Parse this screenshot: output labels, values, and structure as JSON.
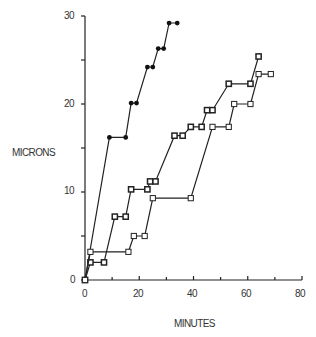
{
  "chart_data": {
    "type": "line",
    "title": "",
    "xlabel": "MINUTES",
    "ylabel": "MICRONS",
    "xlim": [
      0,
      80
    ],
    "ylim": [
      0,
      30
    ],
    "x_ticks": [
      0,
      20,
      40,
      60,
      80
    ],
    "y_ticks": [
      0,
      10,
      20,
      30
    ],
    "grid": false,
    "legend": null,
    "series": [
      {
        "name": "filled-diamonds",
        "marker": "filled",
        "x": [
          0,
          9,
          15,
          17,
          19,
          23,
          25,
          27,
          29,
          31,
          34
        ],
        "y": [
          0,
          16.2,
          16.2,
          20.1,
          20.1,
          24.2,
          24.2,
          26.3,
          26.3,
          29.2,
          29.2
        ]
      },
      {
        "name": "open-squares-upper",
        "marker": "open-square-bold",
        "x": [
          0,
          2,
          7,
          11,
          15,
          17,
          23,
          24,
          26,
          33,
          36,
          39,
          43,
          45,
          47,
          53,
          61,
          64
        ],
        "y": [
          0,
          2,
          2,
          7.2,
          7.2,
          10.3,
          10.3,
          11.2,
          11.2,
          16.4,
          16.4,
          17.4,
          17.4,
          19.3,
          19.3,
          22.3,
          22.3,
          25.4
        ]
      },
      {
        "name": "open-squares-lower",
        "marker": "open-square",
        "x": [
          0,
          2,
          16,
          18,
          22,
          25,
          39,
          47,
          53,
          55,
          61,
          64,
          68.5
        ],
        "y": [
          0,
          3.2,
          3.2,
          5,
          5,
          9.3,
          9.3,
          17.4,
          17.4,
          20,
          20,
          23.4,
          23.4
        ]
      }
    ]
  },
  "axes": {
    "xlabel": "MINUTES",
    "ylabel": "MICRONS",
    "x_tick_labels": [
      "0",
      "20",
      "40",
      "60",
      "80"
    ],
    "y_tick_labels": [
      "0",
      "10",
      "20",
      "30"
    ]
  }
}
